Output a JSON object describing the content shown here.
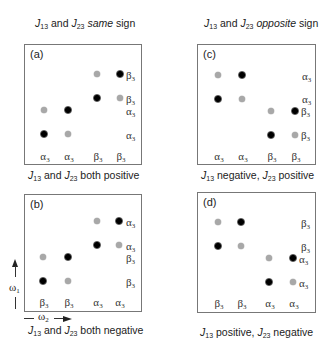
{
  "headers": {
    "left": {
      "j1": "J",
      "s1": "13",
      "mid": " and ",
      "j2": "J",
      "s2": "23",
      "emph": "same",
      "tail": " sign"
    },
    "right": {
      "j1": "J",
      "s1": "13",
      "mid": " and ",
      "j2": "J",
      "s2": "23",
      "emph": "opposite",
      "tail": " sign"
    }
  },
  "panels": {
    "a": {
      "label": "(a)",
      "caption": {
        "j1": "J",
        "s1": "13",
        "mid": " and ",
        "j2": "J",
        "s2": "23",
        "tail": " both positive"
      },
      "side_labels": [
        {
          "sym": "β",
          "sub": "3"
        },
        {
          "sym": "β",
          "sub": "3"
        },
        {
          "sym": "α",
          "sub": "3"
        },
        {
          "sym": "α",
          "sub": "3"
        }
      ],
      "bottom_labels": [
        {
          "sym": "α",
          "sub": "3"
        },
        {
          "sym": "α",
          "sub": "3"
        },
        {
          "sym": "β",
          "sub": "3"
        },
        {
          "sym": "β",
          "sub": "3"
        }
      ]
    },
    "b": {
      "label": "(b)",
      "caption": {
        "j1": "J",
        "s1": "13",
        "mid": " and ",
        "j2": "J",
        "s2": "23",
        "tail": " both negative"
      },
      "side_labels": [
        {
          "sym": "α",
          "sub": "3"
        },
        {
          "sym": "α",
          "sub": "3"
        },
        {
          "sym": "β",
          "sub": "3"
        },
        {
          "sym": "β",
          "sub": "3"
        }
      ],
      "bottom_labels": [
        {
          "sym": "β",
          "sub": "3"
        },
        {
          "sym": "β",
          "sub": "3"
        },
        {
          "sym": "α",
          "sub": "3"
        },
        {
          "sym": "α",
          "sub": "3"
        }
      ]
    },
    "c": {
      "label": "(c)",
      "caption": {
        "j1": "J",
        "s1": "13",
        "mid": " negative, ",
        "j2": "J",
        "s2": "23",
        "tail": " positive"
      },
      "side_labels": [
        {
          "sym": "α",
          "sub": "3"
        },
        {
          "sym": "α",
          "sub": "3"
        },
        {
          "sym": "β",
          "sub": "3"
        },
        {
          "sym": "β",
          "sub": "3"
        }
      ],
      "bottom_labels": [
        {
          "sym": "α",
          "sub": "3"
        },
        {
          "sym": "α",
          "sub": "3"
        },
        {
          "sym": "β",
          "sub": "3"
        },
        {
          "sym": "β",
          "sub": "3"
        }
      ]
    },
    "d": {
      "label": "(d)",
      "caption": {
        "j1": "J",
        "s1": "13",
        "mid": " positive, ",
        "j2": "J",
        "s2": "23",
        "tail": " negative"
      },
      "side_labels": [
        {
          "sym": "β",
          "sub": "3"
        },
        {
          "sym": "β",
          "sub": "3"
        },
        {
          "sym": "α",
          "sub": "3"
        },
        {
          "sym": "α",
          "sub": "3"
        }
      ],
      "bottom_labels": [
        {
          "sym": "β",
          "sub": "3"
        },
        {
          "sym": "β",
          "sub": "3"
        },
        {
          "sym": "α",
          "sub": "3"
        },
        {
          "sym": "α",
          "sub": "3"
        }
      ]
    }
  },
  "axes": {
    "w1": {
      "sym": "ω",
      "sub": "1"
    },
    "w2": {
      "sym": "ω",
      "sub": "2"
    }
  },
  "colors": {
    "dark_peak": "#000000",
    "light_peak": "#a8a8a8",
    "frame": "#777777"
  }
}
